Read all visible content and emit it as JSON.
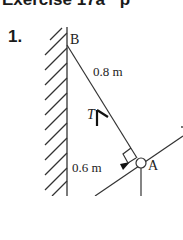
{
  "header": {
    "title": "Exercise 17a",
    "cut_text": "p"
  },
  "question": {
    "number": "1."
  },
  "diagram": {
    "labels": {
      "point_b": "B",
      "point_a": "A",
      "length_ba": "0.8 m",
      "length_ax": "0.6 m",
      "tension": "T"
    },
    "colors": {
      "line": "#333333",
      "text": "#222222"
    }
  }
}
